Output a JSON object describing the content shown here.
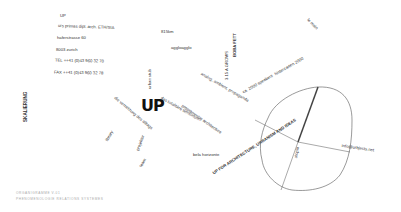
{
  "contact": {
    "name": "UP",
    "line1": "urs primas dipl. arch. ETH/SIA",
    "street": "haferstrasse 60",
    "city": "8003 zurich",
    "tel": "TEL ++41 (0)43 960 32 70",
    "fax": "FAX ++41 (0)43 960 32 78"
  },
  "logo": "UP",
  "vertical_label": "SKALIERUNG",
  "tags": {
    "km": "815km",
    "aggloagglo": "aggloagglo",
    "boba": "BOBA FETT",
    "stadion": "3 15 A GROWS",
    "lemain": "le main",
    "speakers": "ca. 2000 speakers",
    "hinterland": "hinterzarten 2000",
    "analog": "analog, ambient, propaganda",
    "urban": "urban stub",
    "vernetzung": "die vernetzung des alltags",
    "library": "library",
    "projektor": "projektor",
    "team": "team",
    "programming": "programming architecture",
    "das_territory": "das totalitäre territorium",
    "bela": "bela horizonte",
    "slogan": "UP FOR ARCHITECTURE, URBANISM AND IDEAS",
    "utopia": "utopia",
    "email": "info@urbjects.net"
  },
  "footer": {
    "line1": "ORGANIGRAMME  V.01",
    "line2": "PHENOMENOLOGIE  RELATIONS  SYSTEMES"
  }
}
